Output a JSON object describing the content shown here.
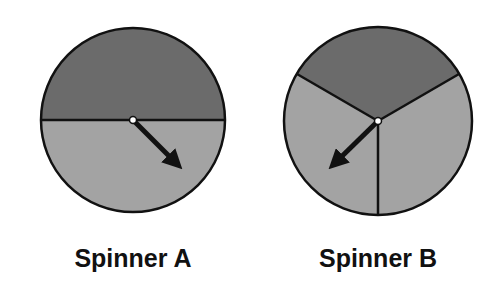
{
  "spinners": [
    {
      "label": "Spinner A",
      "sections": 2,
      "center": [
        133,
        120
      ],
      "radius": 92,
      "colors": {
        "dark": "#6b6b6b",
        "light": "#a3a3a3"
      },
      "arrow_tip": [
        183,
        170
      ]
    },
    {
      "label": "Spinner B",
      "sections": 3,
      "center": [
        378,
        121
      ],
      "radius": 94,
      "colors": {
        "dark": "#6b6b6b",
        "light": "#a3a3a3"
      },
      "arrow_tip": [
        328,
        170
      ]
    }
  ]
}
